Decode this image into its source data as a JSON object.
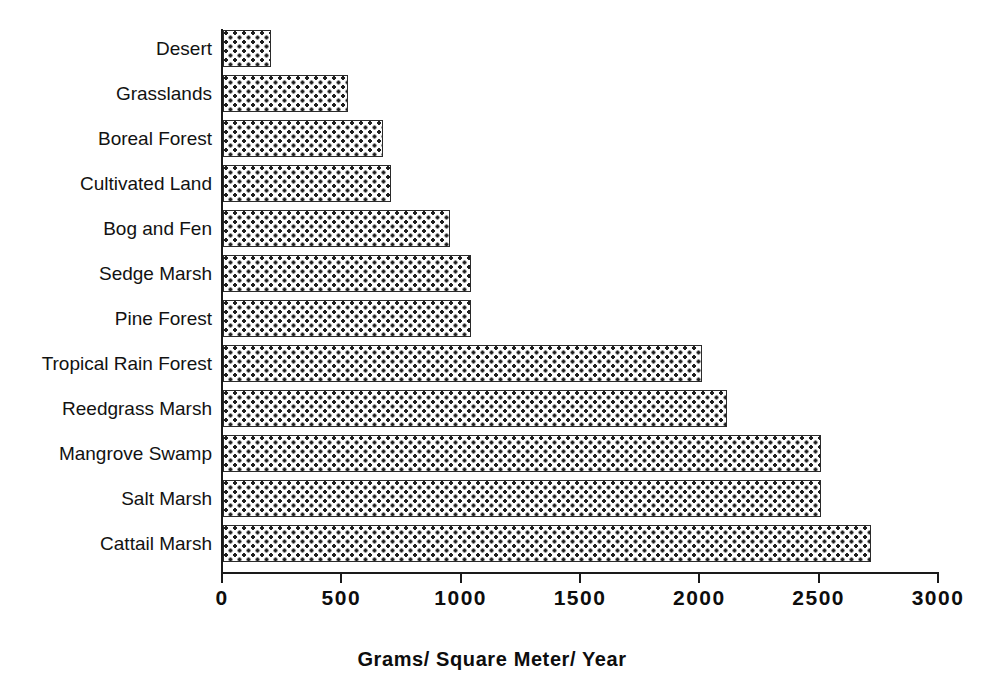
{
  "chart_data": {
    "type": "bar",
    "orientation": "horizontal",
    "title": "",
    "subtitle": "",
    "xlabel": "Grams/ Square Meter/ Year",
    "ylabel": "",
    "xlim": [
      0,
      3000
    ],
    "xticks": [
      0,
      500,
      1000,
      1500,
      2000,
      2500,
      3000
    ],
    "xtick_labels": [
      "0",
      "500",
      "1000",
      "1500",
      "2000",
      "2500",
      "3000"
    ],
    "grid": false,
    "legend": null,
    "categories": [
      "Desert",
      "Grasslands",
      "Boreal  Forest",
      "Cultivated  Land",
      "Bog and Fen",
      "Sedge Marsh",
      "Pine  Forest",
      "Tropical  Rain  Forest",
      "Reedgrass Marsh",
      "Mangrove Swamp",
      "Salt  Marsh",
      "Cattail  Marsh"
    ],
    "values": [
      200,
      525,
      670,
      705,
      950,
      1040,
      1040,
      2005,
      2110,
      2505,
      2505,
      2715
    ],
    "series": [
      {
        "name": "Net Primary Productivity",
        "values": [
          200,
          525,
          670,
          705,
          950,
          1040,
          1040,
          2005,
          2110,
          2505,
          2505,
          2715
        ]
      }
    ],
    "bar_fill": "dotted-triangle-hatch",
    "bar_edge_color": "#2b2b2b",
    "bar_face_color": "#fdfdfd"
  }
}
